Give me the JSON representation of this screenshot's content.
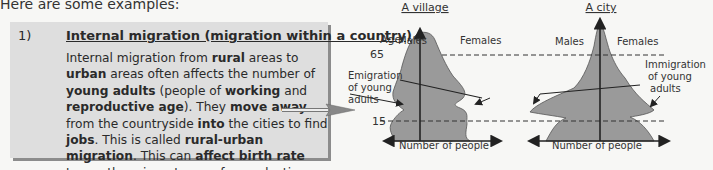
{
  "intro": "Here are some examples:",
  "example": {
    "number": "1)",
    "title": "Internal migration (migration within a country)",
    "paragraph_segments": [
      {
        "t": "Internal migration from ",
        "b": false
      },
      {
        "t": "rural",
        "b": true
      },
      {
        "t": " areas to ",
        "b": false
      },
      {
        "t": "urban",
        "b": true
      },
      {
        "t": " areas often affects the number of ",
        "b": false
      },
      {
        "t": "young adults",
        "b": true
      },
      {
        "t": " (people of ",
        "b": false
      },
      {
        "t": "working",
        "b": true
      },
      {
        "t": " and ",
        "b": false
      },
      {
        "t": "reproductive age",
        "b": true
      },
      {
        "t": "). They ",
        "b": false
      },
      {
        "t": "move away",
        "b": true
      },
      {
        "t": " from the countryside ",
        "b": false
      },
      {
        "t": "into",
        "b": true
      },
      {
        "t": " the cities to find ",
        "b": false
      },
      {
        "t": "jobs",
        "b": true
      },
      {
        "t": ". This is called ",
        "b": false
      },
      {
        "t": "rural-urban migration",
        "b": true
      },
      {
        "t": ". This can ",
        "b": false
      },
      {
        "t": "affect birth rate",
        "b": true
      },
      {
        "t": " too as the migrants are of reproductive age.",
        "b": false
      }
    ]
  },
  "diagram": {
    "village": {
      "title": "A village",
      "age_label": "Age",
      "age_65": "65",
      "age_15": "15",
      "males": "Males",
      "females": "Females",
      "annotation": [
        "Emigration",
        "of young",
        "adults"
      ],
      "xlabel": "Number of people"
    },
    "city": {
      "title": "A city",
      "males": "Males",
      "females": "Females",
      "annotation": [
        "Immigration",
        "of young",
        "adults"
      ],
      "xlabel": "Number of people"
    },
    "colors": {
      "pyramid_fill": "#9a9a9a",
      "line": "#222222",
      "box_bg": "#dedede",
      "box_shadow": "#8c8c8c"
    }
  }
}
